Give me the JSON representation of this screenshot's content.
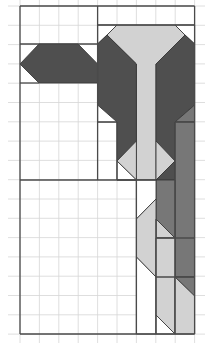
{
  "title": "Quilt block pattern diagram",
  "colors": {
    "background": "#ffffff",
    "grid": "#d6d6d6",
    "frame": "#4a4a4a",
    "dark": "#4f4f4f",
    "medium": "#777777",
    "light": "#d2d2d2",
    "white": "#ffffff"
  },
  "grid": {
    "origin_x": 20,
    "origin_y": 6,
    "cell": 19.4,
    "cell_y": 19.3,
    "columns": 9,
    "rows": 17
  },
  "frame_lines": [
    [
      20,
      6,
      194.6,
      6
    ],
    [
      20,
      6,
      20,
      334
    ],
    [
      194.6,
      6,
      194.6,
      334
    ],
    [
      20,
      334,
      194.6,
      334
    ],
    [
      97.6,
      6,
      97.6,
      180
    ],
    [
      97.6,
      25,
      194.6,
      25
    ],
    [
      20,
      44,
      97.6,
      44
    ],
    [
      20,
      83,
      39,
      83
    ],
    [
      20,
      180,
      136.4,
      180
    ],
    [
      117,
      122,
      117,
      180
    ],
    [
      97.6,
      122,
      117,
      122
    ],
    [
      117,
      180,
      156,
      180
    ],
    [
      136.4,
      180,
      136.4,
      334
    ],
    [
      156,
      219,
      156,
      334
    ],
    [
      175,
      122,
      194.6,
      122
    ],
    [
      175,
      122,
      175,
      334
    ],
    [
      156,
      238,
      194.6,
      238
    ],
    [
      156,
      277,
      194.6,
      277
    ]
  ],
  "shapes": [
    {
      "name": "left-arrow-hexagon",
      "fill": "dark",
      "points": "20,64 39,44 78,44 97.6,64 97.6,83 39,83"
    },
    {
      "name": "top-light-funnel",
      "fill": "light",
      "points": "117,25 175,25 185,35 156,64 156,180 136.4,180 136.4,64 107,35"
    },
    {
      "name": "top-left-white-corner",
      "fill": "white",
      "points": "97.6,25 117,25 107,35 97.6,44"
    },
    {
      "name": "top-right-white-corner",
      "fill": "white",
      "points": "175,25 194.6,25 194.6,44 185,35"
    },
    {
      "name": "left-dark-arm",
      "fill": "dark",
      "points": "97.6,44 107,35 136.4,64 136.4,141 117,161 117,122 97.6,105"
    },
    {
      "name": "right-dark-arm",
      "fill": "dark",
      "points": "194.6,44 185,35 156,64 156,141 175,161 175,122 194.6,105"
    },
    {
      "name": "left-white-notch",
      "fill": "white",
      "points": "97.6,105 117,122 97.6,122"
    },
    {
      "name": "right-medium-notch",
      "fill": "medium",
      "points": "194.6,105 194.6,122 175,122"
    },
    {
      "name": "diamond-left-half",
      "fill": "light",
      "points": "136.4,141 117,161 136.4,180"
    },
    {
      "name": "diamond-left-white",
      "fill": "white",
      "points": "117,161 136.4,180 117,180"
    },
    {
      "name": "diamond-right-half",
      "fill": "light",
      "points": "156,141 175,161 156,180"
    },
    {
      "name": "diamond-right-dark",
      "fill": "dark",
      "points": "175,161 175,180 156,180"
    },
    {
      "name": "right-medium-column",
      "fill": "medium",
      "points": "175,122 194.6,122 194.6,277 175,277"
    },
    {
      "name": "lower-medium-block",
      "fill": "medium",
      "points": "156,180 175,180 175,238 156,219"
    },
    {
      "name": "lower-light-wedge",
      "fill": "light",
      "points": "156,219 175,238 156,238"
    },
    {
      "name": "col6-white-top",
      "fill": "white",
      "points": "136.4,180 156,180 156,199 136.4,219"
    },
    {
      "name": "col6-light",
      "fill": "light",
      "points": "156,199 156,277 136.4,257 136.4,219"
    },
    {
      "name": "col6-white-bottom",
      "fill": "white",
      "points": "136.4,257 156,277 156,334 136.4,334"
    },
    {
      "name": "col7-light",
      "fill": "light",
      "points": "156,238 175,238 175,334 156,315"
    },
    {
      "name": "col7-white-corner",
      "fill": "white",
      "points": "156,315 175,334 156,334"
    },
    {
      "name": "col8-dark-wedge",
      "fill": "medium",
      "points": "175,277 194.6,277 194.6,296"
    },
    {
      "name": "col8-light",
      "fill": "light",
      "points": "175,277 194.6,296 194.6,334 175,334"
    }
  ]
}
